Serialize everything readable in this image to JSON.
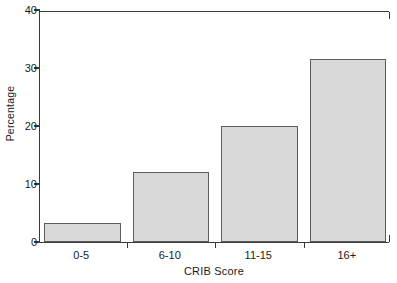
{
  "chart_data": {
    "type": "bar",
    "title": "",
    "xlabel": "CRIB Score",
    "ylabel": "Percentage",
    "categories": [
      "0-5",
      "6-10",
      "11-15",
      "16+"
    ],
    "values": [
      3.3,
      12.0,
      20.0,
      31.5
    ],
    "ylim": [
      0,
      40
    ],
    "yticks": [
      0,
      10,
      20,
      30,
      40
    ],
    "ytick_labels": [
      "0",
      "10",
      "20",
      "30",
      "40"
    ],
    "grid": false,
    "legend": "none",
    "bar_fill_color": "#d9d9d9",
    "bar_edge_color": "#5d5d5d",
    "axis_color": "#3a3a3a",
    "background_color": "#ffffff"
  }
}
